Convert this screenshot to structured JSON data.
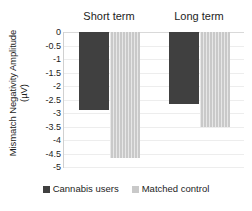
{
  "chart_data": {
    "type": "bar",
    "title": "",
    "xlabel": "",
    "ylabel": "Mismatch Negativity Amplitude (µV)",
    "ylabel_line1": "Mismatch Negativity Amplitude",
    "ylabel_line2": "(µV)",
    "categories": [
      "Short term",
      "Long term"
    ],
    "series": [
      {
        "name": "Cannabis users",
        "values": [
          -2.9,
          -2.65
        ],
        "color": "#404040"
      },
      {
        "name": "Matched control",
        "values": [
          -4.65,
          -3.5
        ],
        "color": "#c9c9c9"
      }
    ],
    "ylim": [
      -5,
      0
    ],
    "ytick_labels": [
      "0",
      "-0.5",
      "-1",
      "-1.5",
      "-2",
      "-2.5",
      "-3",
      "-3.5",
      "-4",
      "-4.5",
      "-5"
    ],
    "ytick_values": [
      0,
      -0.5,
      -1,
      -1.5,
      -2,
      -2.5,
      -3,
      -3.5,
      -4,
      -4.5,
      -5
    ],
    "grid": true,
    "legend_position": "bottom",
    "category_label_position": "top"
  },
  "legend": {
    "items": [
      {
        "label": "Cannabis users",
        "color": "#404040"
      },
      {
        "label": "Matched control",
        "color": "#c9c9c9"
      }
    ]
  }
}
